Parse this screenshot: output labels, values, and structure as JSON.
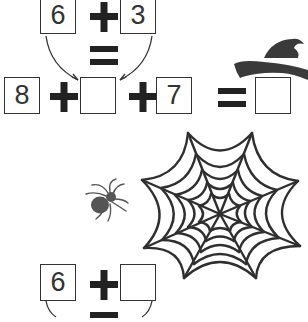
{
  "worksheet": {
    "top_equation": {
      "left": "6",
      "operator": "+",
      "right": "3",
      "result_symbol": "="
    },
    "main_equation": {
      "first": "8",
      "op1": "+",
      "second": "",
      "op2": "+",
      "third": "7",
      "equals": "=",
      "answer": ""
    },
    "bottom_equation": {
      "left": "6",
      "operator": "+",
      "right": "",
      "result_symbol": "="
    }
  },
  "icons": [
    "witch-hat-icon",
    "spider-icon",
    "spider-web-icon",
    "arrow-icon"
  ],
  "colors": {
    "ink": "#333333",
    "icon_fill": "#444444",
    "spider": "#555555",
    "background": "#ffffff"
  }
}
